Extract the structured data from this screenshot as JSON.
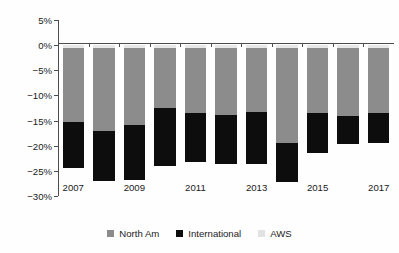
{
  "chart_data": {
    "type": "bar",
    "stacked": true,
    "title": "",
    "subtitle": "",
    "xlabel": "",
    "ylabel": "Sales growth QOQ",
    "ylim": [
      -30,
      5
    ],
    "xlim_categories": [
      "2007",
      "2008",
      "2009",
      "2010",
      "2011",
      "2012",
      "2013",
      "2014",
      "2015",
      "2016",
      "2017"
    ],
    "categories": [
      "2007",
      "2008",
      "2009",
      "2010",
      "2011",
      "2012",
      "2013",
      "2014",
      "2015",
      "2016",
      "2017"
    ],
    "x_tick_labels": [
      "2007",
      "2009",
      "2011",
      "2013",
      "2015",
      "2017"
    ],
    "x_tick_categories": [
      "2007",
      "2009",
      "2011",
      "2013",
      "2015",
      "2017"
    ],
    "y_tick_labels": [
      "5%",
      "0%",
      "-5%",
      "-10%",
      "-15%",
      "-20%",
      "-25%",
      "-30%"
    ],
    "y_ticks": [
      5,
      0,
      -5,
      -10,
      -15,
      -20,
      -25,
      -30
    ],
    "grid": false,
    "legend_position": "bottom",
    "series": [
      {
        "name": "AWS",
        "color": "#e8e8e8",
        "values": [
          -0.6,
          -0.5,
          -0.5,
          -0.6,
          -0.5,
          -0.5,
          -0.5,
          -0.5,
          -0.6,
          -0.5,
          -0.5
        ]
      },
      {
        "name": "North Am",
        "color": "#8c8c8c",
        "values": [
          -14.7,
          -16.5,
          -15.3,
          -11.9,
          -13.0,
          -13.3,
          -12.7,
          -19.0,
          -12.9,
          -13.5,
          -13.0
        ]
      },
      {
        "name": "International",
        "color": "#0d0d0d",
        "values": [
          -9.2,
          -10.0,
          -11.0,
          -11.5,
          -9.8,
          -9.9,
          -10.5,
          -7.8,
          -8.0,
          -5.7,
          -6.0
        ]
      }
    ],
    "cumulative_bottoms": {
      "north_am_cumulative": [
        -15.3,
        -17.0,
        -15.8,
        -12.5,
        -13.5,
        -13.8,
        -13.2,
        -19.5,
        -13.5,
        -14.0,
        -13.5
      ],
      "total": [
        -24.5,
        -27.0,
        -26.8,
        -24.0,
        -23.3,
        -23.7,
        -23.7,
        -27.3,
        -21.5,
        -19.7,
        -19.5
      ]
    }
  },
  "legend": {
    "items": [
      {
        "label": "North Am",
        "color": "#8c8c8c"
      },
      {
        "label": "International",
        "color": "#0d0d0d"
      },
      {
        "label": "AWS",
        "color": "#e2e2e2"
      }
    ]
  },
  "axes": {
    "y_title": "Sales growth QOQ",
    "y_labels": [
      "5%",
      "0%",
      "−5%",
      "−10%",
      "−15%",
      "−20%",
      "−25%",
      "−30%"
    ],
    "x_labels": [
      "2007",
      "2009",
      "2011",
      "2013",
      "2015",
      "2017"
    ]
  }
}
